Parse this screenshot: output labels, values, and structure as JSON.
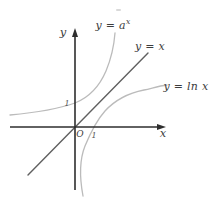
{
  "figure": {
    "axis": {
      "x_label": "x",
      "y_label": "y",
      "origin_label": "O",
      "x_unit_tick": "1",
      "y_unit_tick": "1"
    },
    "curves": {
      "exponential": {
        "label_base": "y = a",
        "label_exponent": "x"
      },
      "identity": {
        "label": "y = x"
      },
      "logarithm": {
        "label": "y = ln x"
      }
    },
    "colors": {
      "background": "#ffffff",
      "axis": "#2e2e2e",
      "identity_line": "#606060",
      "curve": "#bbbbbb",
      "text": "#3d3d3d"
    }
  }
}
